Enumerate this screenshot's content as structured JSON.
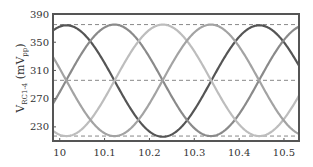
{
  "chart_data": {
    "type": "line",
    "title": "",
    "xlabel": "",
    "ylabel": "V_RC1-4 (mV_pp)",
    "ylabel_main": "V",
    "ylabel_sub": "RC1-4",
    "ylabel_unit_open": " (mV",
    "ylabel_unit_sub": "pp",
    "ylabel_unit_close": ")",
    "xlim": [
      9.985,
      10.5335
    ],
    "ylim": [
      210,
      390
    ],
    "x_ticks": [
      10,
      10.1,
      10.2,
      10.3,
      10.4,
      10.5
    ],
    "x_tick_labels": [
      "10",
      "10.1",
      "10.2",
      "10.3",
      "10.4",
      "10.5"
    ],
    "y_ticks": [
      230,
      270,
      310,
      350,
      390
    ],
    "y_tick_labels": [
      "230",
      "270",
      "310",
      "350",
      "390"
    ],
    "reference_lines": [
      375,
      296,
      217
    ],
    "grid": false,
    "legend": null,
    "series": [
      {
        "name": "RC1",
        "peak_x": 10.015,
        "center": 295,
        "amplitude": 79,
        "period": 0.43,
        "color": "#555555"
      },
      {
        "name": "RC2",
        "peak_x": 10.122,
        "center": 296,
        "amplitude": 79,
        "period": 0.43,
        "color": "#8a8a8a"
      },
      {
        "name": "RC3",
        "peak_x": 10.23,
        "center": 296,
        "amplitude": 79,
        "period": 0.43,
        "color": "#bdbdbd"
      },
      {
        "name": "RC4",
        "peak_x": 10.337,
        "center": 296,
        "amplitude": 79,
        "period": 0.43,
        "color": "#a3a3a3"
      }
    ]
  }
}
